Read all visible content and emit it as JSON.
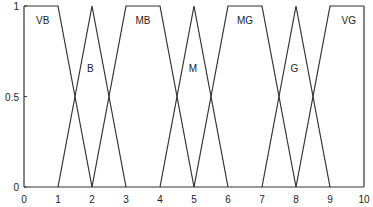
{
  "chart_data": {
    "type": "line",
    "title": "",
    "xlabel": "",
    "ylabel": "",
    "xlim": [
      0,
      10
    ],
    "ylim": [
      0,
      1
    ],
    "grid": false,
    "legend": "none (inline labels)",
    "x_ticks": [
      "0",
      "1",
      "2",
      "3",
      "4",
      "5",
      "6",
      "7",
      "8",
      "9",
      "10"
    ],
    "y_ticks": [
      "0",
      "0.5",
      "1"
    ],
    "series": [
      {
        "name": "VB",
        "shape": "trapezoid",
        "params": [
          0,
          0,
          1,
          2
        ],
        "x": [
          0,
          1,
          2
        ],
        "y": [
          1,
          1,
          0
        ],
        "label_pos": [
          0.55,
          0.92
        ]
      },
      {
        "name": "B",
        "shape": "triangle",
        "params": [
          1,
          2,
          3
        ],
        "x": [
          1,
          2,
          3
        ],
        "y": [
          0,
          1,
          0
        ],
        "label_pos": [
          1.95,
          0.66
        ]
      },
      {
        "name": "MB",
        "shape": "trapezoid",
        "params": [
          2,
          3,
          4,
          5
        ],
        "x": [
          2,
          3,
          4,
          5
        ],
        "y": [
          0,
          1,
          1,
          0
        ],
        "label_pos": [
          3.5,
          0.92
        ]
      },
      {
        "name": "M",
        "shape": "triangle",
        "params": [
          4,
          5,
          6
        ],
        "x": [
          4,
          5,
          6
        ],
        "y": [
          0,
          1,
          0
        ],
        "label_pos": [
          4.97,
          0.66
        ]
      },
      {
        "name": "MG",
        "shape": "trapezoid",
        "params": [
          5,
          6,
          7,
          8
        ],
        "x": [
          5,
          6,
          7,
          8
        ],
        "y": [
          0,
          1,
          1,
          0
        ],
        "label_pos": [
          6.5,
          0.92
        ]
      },
      {
        "name": "G",
        "shape": "triangle",
        "params": [
          7,
          8,
          9
        ],
        "x": [
          7,
          8,
          9
        ],
        "y": [
          0,
          1,
          0
        ],
        "label_pos": [
          7.95,
          0.66
        ]
      },
      {
        "name": "VG",
        "shape": "trapezoid",
        "params": [
          8,
          9,
          10,
          10
        ],
        "x": [
          8,
          9,
          10
        ],
        "y": [
          0,
          1,
          1
        ],
        "label_pos": [
          9.55,
          0.92
        ]
      }
    ]
  },
  "style": {
    "line_color": "#333333",
    "axis_color": "#333333",
    "text_color": "#222222",
    "background": "#ffffff"
  }
}
